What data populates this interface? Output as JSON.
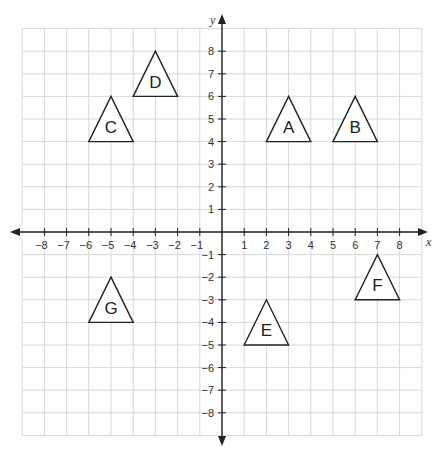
{
  "chart_data": {
    "type": "coordinate-grid",
    "title": "",
    "xlabel": "x",
    "ylabel": "y",
    "xlim": [
      -9,
      9
    ],
    "ylim": [
      -9,
      9
    ],
    "grid": true,
    "x_ticks": [
      -8,
      -7,
      -6,
      -5,
      -4,
      -3,
      -2,
      -1,
      1,
      2,
      3,
      4,
      5,
      6,
      7,
      8
    ],
    "y_ticks": [
      8,
      7,
      6,
      5,
      4,
      3,
      2,
      1,
      -1,
      -2,
      -3,
      -4,
      -5,
      -6,
      -7,
      -8
    ],
    "shapes": [
      {
        "label": "A",
        "vertices": [
          [
            2,
            4
          ],
          [
            4,
            4
          ],
          [
            3,
            6
          ]
        ]
      },
      {
        "label": "B",
        "vertices": [
          [
            5,
            4
          ],
          [
            7,
            4
          ],
          [
            6,
            6
          ]
        ]
      },
      {
        "label": "C",
        "vertices": [
          [
            -6,
            4
          ],
          [
            -4,
            4
          ],
          [
            -5,
            6
          ]
        ]
      },
      {
        "label": "D",
        "vertices": [
          [
            -4,
            6
          ],
          [
            -2,
            6
          ],
          [
            -3,
            8
          ]
        ]
      },
      {
        "label": "E",
        "vertices": [
          [
            1,
            -5
          ],
          [
            3,
            -5
          ],
          [
            2,
            -3
          ]
        ]
      },
      {
        "label": "F",
        "vertices": [
          [
            6,
            -3
          ],
          [
            8,
            -3
          ],
          [
            7,
            -1
          ]
        ]
      },
      {
        "label": "G",
        "vertices": [
          [
            -6,
            -4
          ],
          [
            -4,
            -4
          ],
          [
            -5,
            -2
          ]
        ]
      }
    ]
  },
  "layout": {
    "origin_px": [
      222,
      232
    ],
    "unit_x_px": 22.2,
    "unit_y_px": 22.6,
    "grid_color": "#d8d8d8",
    "axis_color": "#222222",
    "shape_stroke": "#222222"
  }
}
